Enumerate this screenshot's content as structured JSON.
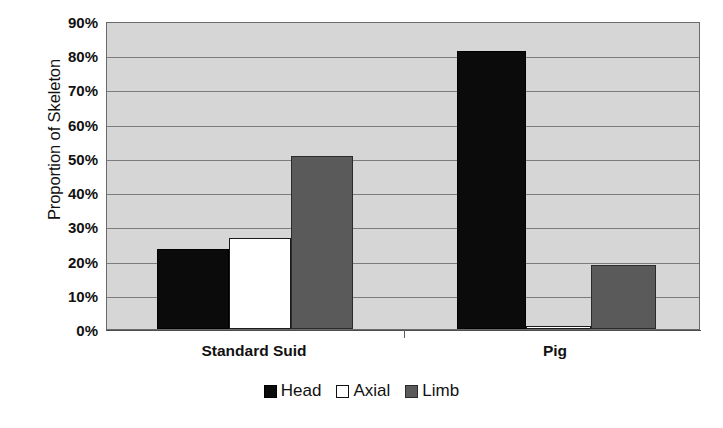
{
  "chart_data": {
    "type": "bar",
    "title": "",
    "xlabel": "",
    "ylabel": "Proportion of Skeleton",
    "categories": [
      "Standard Suid",
      "Pig"
    ],
    "series": [
      {
        "name": "Head",
        "color": "#0b0b0b",
        "values": [
          23.5,
          81.3
        ]
      },
      {
        "name": "Axial",
        "color": "#ffffff",
        "values": [
          26.5,
          1.0
        ]
      },
      {
        "name": "Limb",
        "color": "#5a5a5a",
        "values": [
          50.5,
          18.8
        ]
      }
    ],
    "ylim": [
      0,
      90
    ],
    "ytick_values": [
      0,
      10,
      20,
      30,
      40,
      50,
      60,
      70,
      80,
      90
    ],
    "ytick_labels": [
      "0%",
      "10%",
      "20%",
      "30%",
      "40%",
      "50%",
      "60%",
      "70%",
      "80%",
      "90%"
    ],
    "grid": true,
    "legend_position": "bottom",
    "plot_background": "#d6d6d6"
  },
  "axis": {
    "y_title": "Proportion of Skeleton"
  },
  "legend": {
    "items": [
      {
        "label": "Head",
        "swatch": "black-square-icon"
      },
      {
        "label": "Axial",
        "swatch": "white-square-icon"
      },
      {
        "label": "Limb",
        "swatch": "gray-square-icon"
      }
    ]
  }
}
